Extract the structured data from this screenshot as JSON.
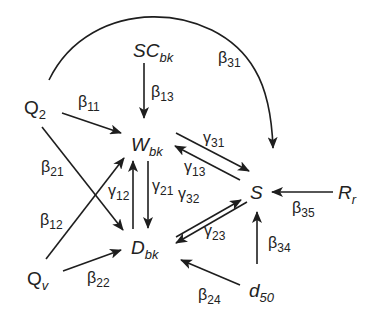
{
  "diagram": {
    "nodes": {
      "Q2": {
        "base": "Q",
        "sub": "2",
        "italic": false
      },
      "SCbk": {
        "base": "SC",
        "sub": "bk",
        "italic": true
      },
      "Wbk": {
        "base": "W",
        "sub": "bk",
        "italic": true
      },
      "Dbk": {
        "base": "D",
        "sub": "bk",
        "italic": true
      },
      "S": {
        "base": "S",
        "sub": "",
        "italic": true
      },
      "Rr": {
        "base": "R",
        "sub": "r",
        "italic": true
      },
      "Qv": {
        "base": "Q",
        "sub": "v",
        "italic": false
      },
      "d50": {
        "base": "d",
        "sub": "50",
        "italic": true
      }
    },
    "edges": [
      {
        "id": "b11",
        "from": "Q2",
        "to": "Wbk",
        "greek": "β",
        "sub": "11"
      },
      {
        "id": "b13",
        "from": "SCbk",
        "to": "Wbk",
        "greek": "β",
        "sub": "13"
      },
      {
        "id": "b31",
        "from": "Q2",
        "to": "S",
        "greek": "β",
        "sub": "31"
      },
      {
        "id": "b21",
        "from": "Q2",
        "to": "Dbk",
        "greek": "β",
        "sub": "21"
      },
      {
        "id": "b12",
        "from": "Qv",
        "to": "Wbk",
        "greek": "β",
        "sub": "12"
      },
      {
        "id": "b22",
        "from": "Qv",
        "to": "Dbk",
        "greek": "β",
        "sub": "22"
      },
      {
        "id": "g12",
        "from": "Dbk",
        "to": "Wbk",
        "greek": "γ",
        "sub": "12"
      },
      {
        "id": "g21",
        "from": "Wbk",
        "to": "Dbk",
        "greek": "γ",
        "sub": "21"
      },
      {
        "id": "g31",
        "from": "Wbk",
        "to": "S",
        "greek": "γ",
        "sub": "31"
      },
      {
        "id": "g13",
        "from": "S",
        "to": "Wbk",
        "greek": "γ",
        "sub": "13"
      },
      {
        "id": "g32",
        "from": "Dbk",
        "to": "S",
        "greek": "γ",
        "sub": "32"
      },
      {
        "id": "g23",
        "from": "S",
        "to": "Dbk",
        "greek": "γ",
        "sub": "23"
      },
      {
        "id": "b35",
        "from": "Rr",
        "to": "S",
        "greek": "β",
        "sub": "35"
      },
      {
        "id": "b34",
        "from": "d50",
        "to": "S",
        "greek": "β",
        "sub": "34"
      },
      {
        "id": "b24",
        "from": "d50",
        "to": "Dbk",
        "greek": "β",
        "sub": "24"
      }
    ],
    "colors": {
      "ink": "#1e1e1e",
      "background": "#ffffff"
    }
  }
}
